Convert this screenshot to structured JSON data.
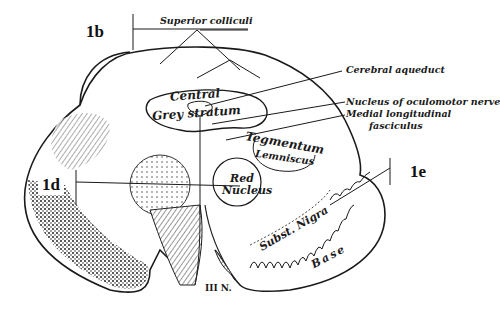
{
  "figure": {
    "labels": {
      "superior_colliculi": "Superior colliculi",
      "cerebral_aqueduct": "Cerebral aqueduct",
      "nucleus_oculomotor": "Nucleus of oculomotor nerve",
      "mlf_line1": "Medial longitudinal",
      "mlf_line2": "fasciculus",
      "central": "Central",
      "grey_stratum": "Grey stratum",
      "tegmentum": "Tegmentum",
      "lemniscus": "Lemniscus",
      "red": "Red",
      "nucleus": "Nucleus",
      "subst_nigra": "Subst. Nigra",
      "base": "Base",
      "third_nerve": "III N."
    },
    "codes": {
      "b": "1b",
      "d": "1d",
      "e": "1e"
    },
    "colors": {
      "ink": "#1a1a1a",
      "background": "#ffffff",
      "stipple": "#2b2b2b"
    }
  }
}
